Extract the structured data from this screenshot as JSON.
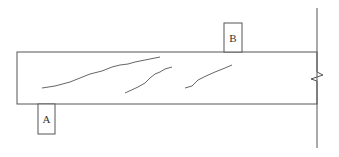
{
  "diagram": {
    "stroke_color": "#555555",
    "crack_color": "#666666",
    "beam": {
      "x": 17,
      "y": 52,
      "width": 300,
      "height": 52
    },
    "wall": {
      "x": 317,
      "y_top": 8,
      "y_bottom": 148
    },
    "blocks": [
      {
        "id": "A",
        "label": "A",
        "x": 38,
        "y": 104,
        "width": 17,
        "height": 30,
        "position": "below beam, left end"
      },
      {
        "id": "B",
        "label": "B",
        "x": 224,
        "y": 23,
        "width": 18,
        "height": 29,
        "position": "above beam, near wall"
      }
    ],
    "cracks": [
      {
        "id": "crack-1",
        "points": "42,88 55,86 70,82 80,78 90,74 102,71 112,67 120,65 128,64 135,62 145,60 155,58 160,57"
      },
      {
        "id": "crack-2",
        "points": "125,93 138,87 145,83 150,78 155,74 160,72 165,69 172,67"
      },
      {
        "id": "crack-3",
        "points": "185,88 192,86 198,80 206,76 215,72 225,68 232,65"
      }
    ]
  }
}
